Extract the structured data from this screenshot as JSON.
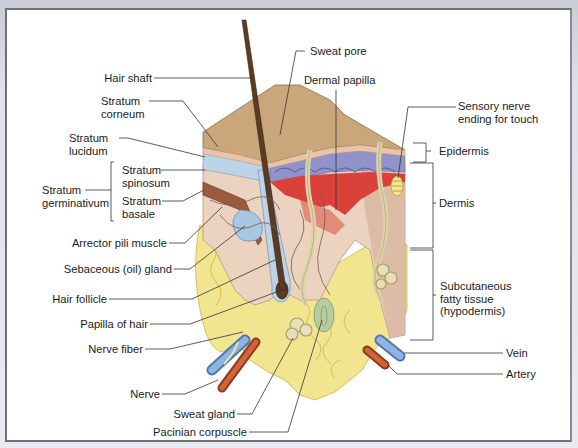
{
  "diagram": {
    "labels_left": {
      "hair_shaft": "Hair shaft",
      "stratum_corneum": [
        "Stratum",
        "corneum"
      ],
      "stratum_lucidum": [
        "Stratum",
        "lucidum"
      ],
      "stratum_spinosum": [
        "Stratum",
        "spinosum"
      ],
      "stratum_basale": [
        "Stratum",
        "basale"
      ],
      "stratum_germinativum": [
        "Stratum",
        "germinativum"
      ],
      "arrector_pili": "Arrector pili muscle",
      "sebaceous_gland": "Sebaceous (oil) gland",
      "hair_follicle": "Hair follicle",
      "papilla_of_hair": "Papilla of hair",
      "nerve_fiber": "Nerve fiber",
      "nerve": "Nerve",
      "sweat_gland": "Sweat gland",
      "pacinian_corpuscle": "Pacinian corpuscle"
    },
    "labels_top": {
      "sweat_pore": "Sweat pore",
      "dermal_papilla": "Dermal papilla"
    },
    "labels_right": {
      "sensory_nerve": [
        "Sensory nerve",
        "ending for touch"
      ],
      "epidermis": "Epidermis",
      "dermis": "Dermis",
      "subcutaneous": [
        "Subcutaneous",
        "fatty tissue",
        "(hypodermis)"
      ],
      "vein": "Vein",
      "artery": "Artery"
    },
    "colors": {
      "surface": "#c9a77a",
      "epidermis": "#e8c4a8",
      "stratum_blue": "#bcd3e8",
      "dermis": "#ecd3c0",
      "papilla_red": "#d9413a",
      "fat": "#f2e58f",
      "vein": "#6f9bd0",
      "artery": "#c8572f",
      "hair": "#5b3b24",
      "muscle": "#9a5a3c"
    }
  }
}
